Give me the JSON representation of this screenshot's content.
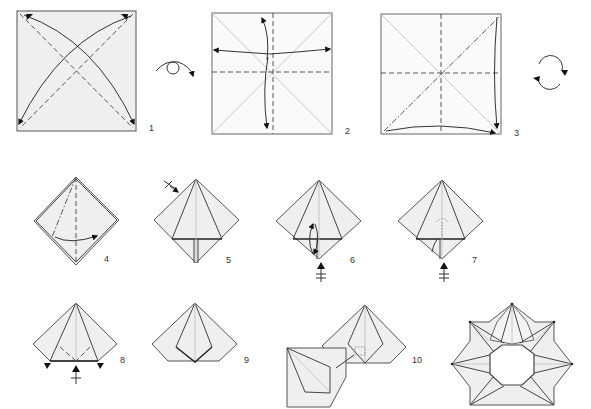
{
  "diagram": {
    "steps": [
      {
        "number": "1",
        "description": "Fold and unfold both diagonals (valley folds)"
      },
      {
        "number": "2",
        "description": "Fold and unfold horizontal and vertical center lines"
      },
      {
        "number": "3",
        "description": "Collapse along diagonal mountain fold into preliminary base"
      },
      {
        "number": "4",
        "description": "Fold flap across to the right along dashed line"
      },
      {
        "number": "5",
        "description": "Kite shape; repeat on the back"
      },
      {
        "number": "6",
        "description": "Fold lower flap up and back down"
      },
      {
        "number": "7",
        "description": "Inside fold shown with hidden line"
      },
      {
        "number": "8",
        "description": "Fold bottom corners in along valley lines"
      },
      {
        "number": "9",
        "description": "Finished unit"
      },
      {
        "number": "10",
        "description": "Insert one unit into another to join"
      },
      {
        "number": "",
        "description": "Completed eight-unit star wreath"
      }
    ],
    "symbols": {
      "turn_over": "turn-over-symbol",
      "rotate": "rotate-symbol",
      "repeat_behind": "repeat-behind-symbol"
    },
    "colors": {
      "paper": "#efefef",
      "line": "#444444",
      "background": "#ffffff"
    }
  }
}
